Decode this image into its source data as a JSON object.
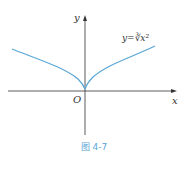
{
  "figure": {
    "caption": "图 4-7",
    "x_label": "x",
    "y_label": "y",
    "origin_label": "O",
    "function_label": "y=∛x²",
    "curve_color": "#5aa6d6",
    "axis_color": "#333333"
  }
}
